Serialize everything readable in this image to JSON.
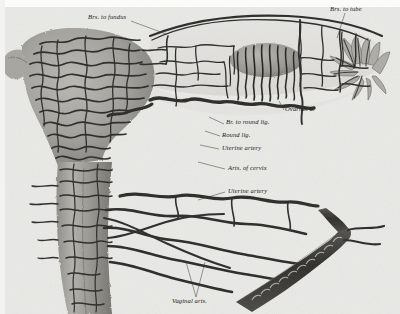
{
  "plate": {
    "kind": "anatomical-engraving",
    "subject": "Arteries of the uterus, ovary and vagina",
    "paper_color": "#e9e9e6",
    "ink_color": "#2a2a28",
    "tissue_color": "#9b9a95"
  },
  "labels": [
    {
      "id": "brs-to-fundus",
      "text": "Brs. to fundus",
      "x": 88,
      "y": 14,
      "leader": "M131,21 L166,34"
    },
    {
      "id": "brs-to-tube",
      "text": "Brs. to tube",
      "x": 330,
      "y": 6,
      "leader": "M345,13 L337,38"
    },
    {
      "id": "ovarian-a",
      "text": "Ovarian a.",
      "x": 285,
      "y": 110,
      "leader": "M284,110 L279,101"
    },
    {
      "id": "br-to-round-lig",
      "text": "Br. to round lig.",
      "x": 226,
      "y": 124,
      "leader": "M224,124 L209,117"
    },
    {
      "id": "round-lig",
      "text": "Round lig.",
      "x": 222,
      "y": 137,
      "leader": "M220,136 L205,131"
    },
    {
      "id": "uterine-artery-1",
      "text": "Uterine artery",
      "x": 222,
      "y": 150,
      "leader": "M219,149 L200,145"
    },
    {
      "id": "arts-of-cervix",
      "text": "Arts. of cervix",
      "x": 228,
      "y": 170,
      "leader": "M225,169 L198,162"
    },
    {
      "id": "uterine-artery-2",
      "text": "Uterine artery",
      "x": 228,
      "y": 193,
      "leader": "M225,192 L198,200"
    },
    {
      "id": "vaginal-arts",
      "text": "Vaginal arts.",
      "x": 172,
      "y": 300,
      "leader": "M196,299 L205,268 M196,299 L186,268"
    }
  ],
  "structures": [
    {
      "name": "uterine-body",
      "label": "Body of uterus"
    },
    {
      "name": "cervix",
      "label": "Cervix"
    },
    {
      "name": "ovary",
      "label": "Ovary"
    },
    {
      "name": "fimbriae",
      "label": "Fimbriated extremity of tube"
    },
    {
      "name": "broad-ligament-arcade",
      "label": "Vascular arcade of broad ligament"
    },
    {
      "name": "vaginal-trunk",
      "label": "Vaginal arterial trunk"
    }
  ]
}
